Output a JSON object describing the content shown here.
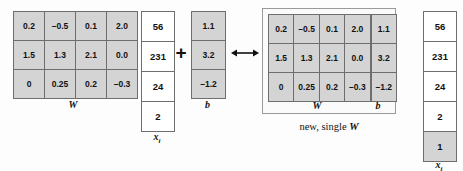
{
  "diagram": {
    "caption": "new, single",
    "caption_symbol": "W",
    "plus_symbol": "+",
    "arrow_symbol": "double-headed-arrow"
  },
  "left": {
    "w_matrix": {
      "label": "W",
      "rows": [
        [
          "0.2",
          "–0.5",
          "0.1",
          "2.0"
        ],
        [
          "1.5",
          "1.3",
          "2.1",
          "0.0"
        ],
        [
          "0",
          "0.25",
          "0.2",
          "–0.3"
        ]
      ]
    },
    "xi_vector": {
      "label": "x",
      "label_sub": "i",
      "values": [
        "56",
        "231",
        "24",
        "2"
      ]
    },
    "b_vector": {
      "label": "b",
      "values": [
        "1.1",
        "3.2",
        "–1.2"
      ]
    }
  },
  "right": {
    "combined_matrix": {
      "w_label": "W",
      "b_label": "b",
      "rows": [
        [
          "0.2",
          "–0.5",
          "0.1",
          "2.0",
          "1.1"
        ],
        [
          "1.5",
          "1.3",
          "2.1",
          "0.0",
          "3.2"
        ],
        [
          "0",
          "0.25",
          "0.2",
          "–0.3",
          "–1.2"
        ]
      ]
    },
    "xi_vector": {
      "label": "x",
      "label_sub": "i",
      "values": [
        "56",
        "231",
        "24",
        "2",
        "1"
      ],
      "appended_value": "1"
    }
  },
  "colors": {
    "cell_fill_gray": "#d4d4d4",
    "cell_fill_white": "#ffffff",
    "cell_border": "#6e6e6e",
    "background": "#fdfdfd"
  }
}
